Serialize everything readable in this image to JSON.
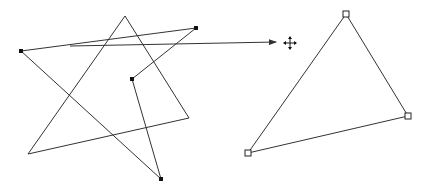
{
  "canvas": {
    "width": 431,
    "height": 193,
    "background": "#ffffff",
    "stroke": "#333333"
  },
  "source_shape": {
    "kind": "closed-polygon",
    "points": [
      [
        21,
        51
      ],
      [
        196,
        28
      ],
      [
        132,
        79
      ],
      [
        161,
        179
      ]
    ],
    "vertex_handle": "filled-square"
  },
  "star_triangle": {
    "kind": "closed-polygon",
    "points": [
      [
        125,
        16
      ],
      [
        189,
        118
      ],
      [
        28,
        154
      ]
    ]
  },
  "move_arrow": {
    "from": [
      70,
      46
    ],
    "to": [
      276,
      42
    ]
  },
  "cursor": {
    "icon": "move-cursor-icon",
    "position": [
      290,
      43
    ]
  },
  "target_shape": {
    "kind": "closed-polygon",
    "points": [
      [
        346,
        14
      ],
      [
        408,
        116
      ],
      [
        248,
        153
      ]
    ],
    "vertex_handle": "hollow-square"
  }
}
